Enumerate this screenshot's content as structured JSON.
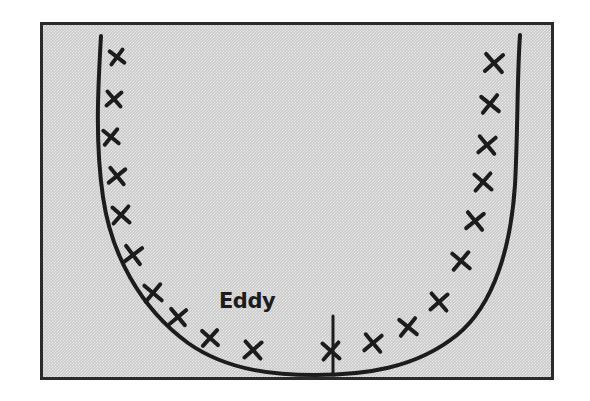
{
  "figure": {
    "medium": "pen sketch on gray halftone background",
    "panel": {
      "background_color": "#c9c9c9",
      "border_color": "#2b2b2b",
      "outer_background_color": "#ffffff",
      "x": 40,
      "y": 22,
      "width": 514,
      "height": 358
    },
    "ink_color": "#1c1c1c",
    "annotations": [
      {
        "name": "eddy-label",
        "text": "Eddy",
        "x": 216,
        "y": 305,
        "leader_line": {
          "name": "eddy-leader-line",
          "x": 290,
          "y_top": 313,
          "y_bottom": 372
        }
      }
    ],
    "curve": {
      "name": "u-shaped-channel-profile",
      "description": "U-shaped concave-up curve resembling a valley or channel cross-section, open at the top, with near-vertical walls and a flat rounded base",
      "path": "M 58 11 C 55 62, 52 118, 60 172 C 68 228, 96 282, 145 318 C 186 347, 236 350, 272 350 C 320 350, 372 344, 414 310 C 452 279, 468 220, 472 160 C 475 104, 474 52, 477 10",
      "stroke_width": 4
    },
    "x_marks": {
      "name": "flow-marker-crosses",
      "description": "Hand-drawn X crosses arranged along the inside of the U curve, denoting flow or velocity sampling points",
      "count": 26,
      "stroke_width": 4,
      "left_wall": [
        {
          "x": 74,
          "y": 32,
          "size": 13,
          "rot": -8
        },
        {
          "x": 71,
          "y": 74,
          "size": 14,
          "rot": 4
        },
        {
          "x": 68,
          "y": 112,
          "size": 14,
          "rot": -6
        },
        {
          "x": 74,
          "y": 151,
          "size": 15,
          "rot": 6
        },
        {
          "x": 78,
          "y": 190,
          "size": 16,
          "rot": -4
        },
        {
          "x": 90,
          "y": 230,
          "size": 16,
          "rot": 8
        }
      ],
      "left_floor": [
        {
          "x": 110,
          "y": 268,
          "size": 16,
          "rot": -5
        },
        {
          "x": 135,
          "y": 292,
          "size": 15,
          "rot": 5
        },
        {
          "x": 167,
          "y": 313,
          "size": 15,
          "rot": -3
        },
        {
          "x": 210,
          "y": 325,
          "size": 16,
          "rot": 4
        }
      ],
      "right_floor": [
        {
          "x": 288,
          "y": 326,
          "size": 16,
          "rot": -4
        },
        {
          "x": 330,
          "y": 318,
          "size": 16,
          "rot": 5
        },
        {
          "x": 365,
          "y": 302,
          "size": 16,
          "rot": -6
        },
        {
          "x": 396,
          "y": 277,
          "size": 16,
          "rot": 4
        }
      ],
      "right_wall": [
        {
          "x": 418,
          "y": 236,
          "size": 16,
          "rot": -5
        },
        {
          "x": 432,
          "y": 196,
          "size": 16,
          "rot": 6
        },
        {
          "x": 440,
          "y": 157,
          "size": 16,
          "rot": -4
        },
        {
          "x": 444,
          "y": 120,
          "size": 16,
          "rot": 5
        },
        {
          "x": 447,
          "y": 79,
          "size": 16,
          "rot": -6
        },
        {
          "x": 451,
          "y": 38,
          "size": 17,
          "rot": 4
        }
      ]
    }
  }
}
